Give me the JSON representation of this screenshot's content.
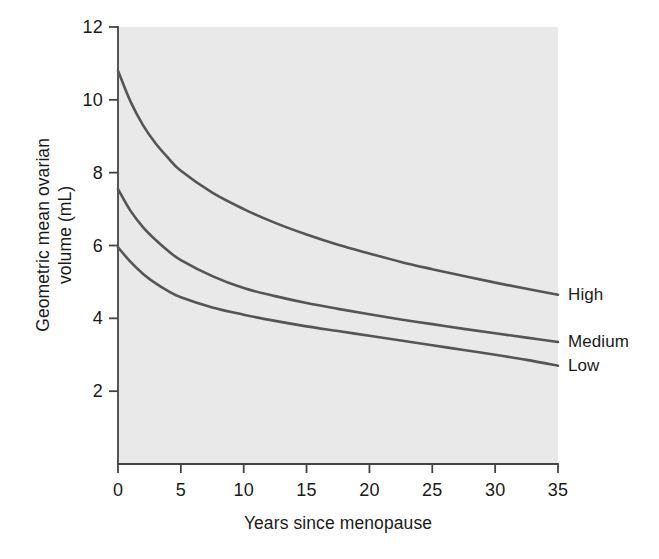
{
  "chart_data": {
    "type": "line",
    "title": "",
    "subtitle": "",
    "xlabel": "Years since menopause",
    "ylabel": "Geometric mean ovarian volume (mL)",
    "ylabel_line1": "Geometric mean ovarian",
    "ylabel_line2": "volume (mL)",
    "xlim": [
      0,
      35
    ],
    "ylim": [
      0,
      12
    ],
    "xticks": [
      0,
      5,
      10,
      15,
      20,
      25,
      30,
      35
    ],
    "yticks": [
      2,
      4,
      6,
      8,
      10,
      12
    ],
    "xtick_labels": [
      "0",
      "5",
      "10",
      "15",
      "20",
      "25",
      "30",
      "35"
    ],
    "ytick_labels": [
      "2",
      "4",
      "6",
      "8",
      "10",
      "12"
    ],
    "grid": false,
    "legend_position": "right-of-axes-inline",
    "plot_background": "#e9e9e9",
    "figure_background": "#ffffff",
    "line_color": "#555555",
    "axis_color": "#444444",
    "x": [
      0,
      1,
      2,
      3,
      4,
      5,
      7.5,
      10,
      12.5,
      15,
      17.5,
      20,
      22.5,
      25,
      27.5,
      30,
      32.5,
      35
    ],
    "series": [
      {
        "name": "High",
        "label": "High",
        "color": "#555555",
        "values": [
          10.8,
          9.95,
          9.3,
          8.8,
          8.4,
          8.05,
          7.45,
          7.0,
          6.62,
          6.3,
          6.02,
          5.78,
          5.55,
          5.35,
          5.16,
          4.98,
          4.81,
          4.65
        ]
      },
      {
        "name": "Medium",
        "label": "Medium",
        "color": "#555555",
        "values": [
          7.55,
          6.95,
          6.5,
          6.15,
          5.85,
          5.6,
          5.16,
          4.83,
          4.61,
          4.42,
          4.26,
          4.11,
          3.97,
          3.84,
          3.71,
          3.59,
          3.47,
          3.35
        ]
      },
      {
        "name": "Low",
        "label": "Low",
        "color": "#555555",
        "values": [
          5.95,
          5.55,
          5.22,
          4.96,
          4.75,
          4.58,
          4.3,
          4.1,
          3.93,
          3.78,
          3.65,
          3.52,
          3.39,
          3.26,
          3.13,
          3.0,
          2.86,
          2.7
        ]
      }
    ]
  }
}
